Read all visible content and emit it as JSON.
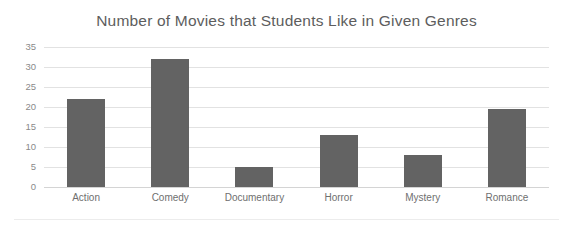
{
  "chart_data": {
    "type": "bar",
    "title": "Number of Movies that Students Like in Given Genres",
    "xlabel": "",
    "ylabel": "",
    "categories": [
      "Action",
      "Comedy",
      "Documentary",
      "Horror",
      "Mystery",
      "Romance"
    ],
    "values": [
      22,
      32,
      5,
      13,
      8,
      19.5
    ],
    "series": [
      {
        "name": "Number of Movies",
        "values": [
          22,
          32,
          5,
          13,
          8,
          19.5
        ]
      }
    ],
    "ylim": [
      0,
      35
    ],
    "y_ticks": [
      0,
      5,
      10,
      15,
      20,
      25,
      30,
      35
    ],
    "y_tick_labels": [
      "0",
      "5",
      "10",
      "15",
      "20",
      "25",
      "30",
      "35"
    ],
    "grid": true,
    "legend": false,
    "legend_position": "none",
    "bar_color": "#636363",
    "grid_color": "#e2e2e2",
    "text_color": "#5d5d5d",
    "background_color": "#ffffff"
  }
}
